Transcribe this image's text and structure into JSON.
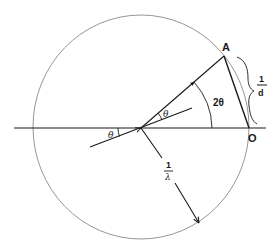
{
  "figure": {
    "type": "Ewald sphere construction",
    "colors": {
      "line": "#1a1a1a",
      "circle": "#8a8a8a",
      "background": "#ffffff"
    },
    "points": {
      "A": {
        "label": "A"
      },
      "O": {
        "label": "O"
      }
    },
    "labels": {
      "theta_incident": "θ",
      "theta_reflect": "θ",
      "two_theta": "2θ",
      "reciprocal_d": {
        "numerator": "1",
        "denominator": "d"
      },
      "reciprocal_lambda": {
        "numerator": "1",
        "denominator": "λ"
      }
    }
  }
}
